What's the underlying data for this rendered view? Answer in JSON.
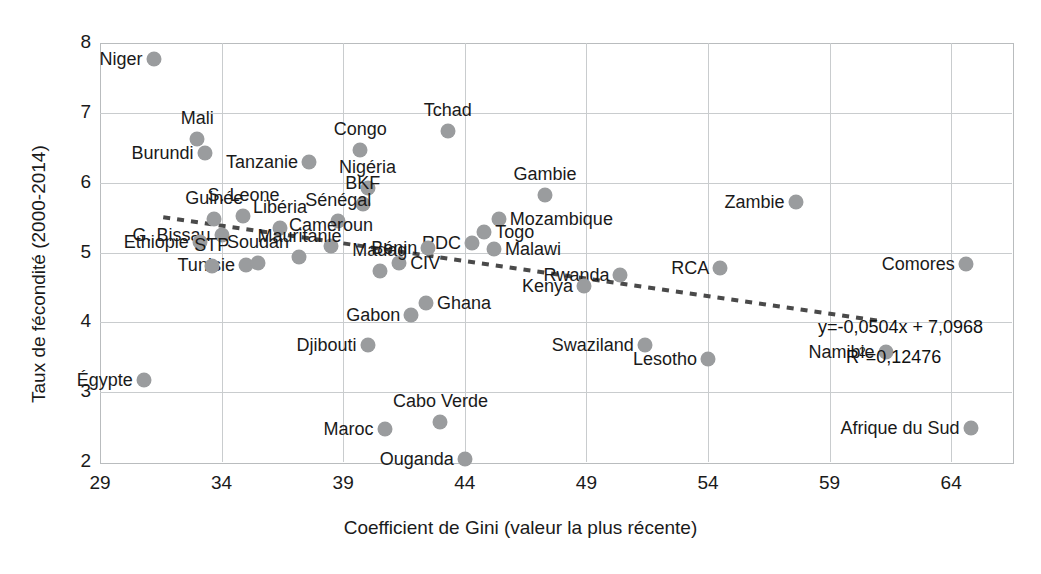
{
  "chart_data": {
    "type": "scatter",
    "title": "",
    "xlabel": "Coefficient de Gini (valeur la plus récente)",
    "ylabel": "Taux de fécondité (2000-2014)",
    "xlim": [
      29,
      66.5
    ],
    "ylim": [
      2,
      8
    ],
    "xticks": [
      29,
      34,
      39,
      44,
      49,
      54,
      59,
      64
    ],
    "yticks": [
      2,
      3,
      4,
      5,
      6,
      7,
      8
    ],
    "grid": true,
    "legend": "none",
    "marker_color": "#9a9c9e",
    "trendline": {
      "style": "dotted",
      "color": "#4a4a4a",
      "slope": -0.0504,
      "intercept": 7.0968,
      "equation": "y=-0,0504x + 7,0968",
      "r2_label": "R²=0,12476",
      "r2": 0.12476,
      "x_start": 31.6,
      "x_end": 61.2
    },
    "points": [
      {
        "label": "Niger",
        "x": 31.2,
        "y": 7.77,
        "label_side": "left"
      },
      {
        "label": "Mali",
        "x": 33.0,
        "y": 6.63,
        "label_side": "above"
      },
      {
        "label": "Burundi",
        "x": 33.3,
        "y": 6.43,
        "label_side": "left"
      },
      {
        "label": "Tanzanie",
        "x": 37.6,
        "y": 6.3,
        "label_side": "left"
      },
      {
        "label": "Congo",
        "x": 39.7,
        "y": 6.47,
        "label_side": "above"
      },
      {
        "label": "Tchad",
        "x": 43.3,
        "y": 6.74,
        "label_side": "above"
      },
      {
        "label": "Nigéria",
        "x": 40.0,
        "y": 5.93,
        "label_side": "above"
      },
      {
        "label": "Gambie",
        "x": 47.3,
        "y": 5.82,
        "label_side": "above"
      },
      {
        "label": "BKF",
        "x": 39.8,
        "y": 5.7,
        "label_side": "above"
      },
      {
        "label": "Zambie",
        "x": 57.6,
        "y": 5.72,
        "label_side": "left"
      },
      {
        "label": "Mozambique",
        "x": 45.4,
        "y": 5.48,
        "label_side": "right"
      },
      {
        "label": "Sénégal",
        "x": 38.8,
        "y": 5.45,
        "label_side": "above"
      },
      {
        "label": "Togo",
        "x": 44.8,
        "y": 5.3,
        "label_side": "right"
      },
      {
        "label": "S. Leone",
        "x": 34.9,
        "y": 5.52,
        "label_side": "above"
      },
      {
        "label": "Guinée",
        "x": 33.7,
        "y": 5.48,
        "label_side": "above"
      },
      {
        "label": "Libéria",
        "x": 36.4,
        "y": 5.35,
        "label_side": "above"
      },
      {
        "label": "RDC",
        "x": 44.3,
        "y": 5.13,
        "label_side": "left"
      },
      {
        "label": "Bénin",
        "x": 42.5,
        "y": 5.06,
        "label_side": "left"
      },
      {
        "label": "G. Bissau",
        "x": 34.0,
        "y": 5.25,
        "label_side": "left"
      },
      {
        "label": "Ethiopie",
        "x": 33.1,
        "y": 5.15,
        "label_side": "left"
      },
      {
        "label": "Cameroun",
        "x": 38.5,
        "y": 5.1,
        "label_side": "above"
      },
      {
        "label": "Malawi",
        "x": 45.2,
        "y": 5.05,
        "label_side": "right"
      },
      {
        "label": "Mauritanie",
        "x": 37.2,
        "y": 4.93,
        "label_side": "above"
      },
      {
        "label": "Tunisie",
        "x": 35.0,
        "y": 4.82,
        "label_side": "left"
      },
      {
        "label": "CIV",
        "x": 41.3,
        "y": 4.85,
        "label_side": "right"
      },
      {
        "label": "Rwanda",
        "x": 50.4,
        "y": 4.68,
        "label_side": "left"
      },
      {
        "label": "RCA",
        "x": 54.5,
        "y": 4.78,
        "label_side": "left"
      },
      {
        "label": "Comores",
        "x": 64.6,
        "y": 4.84,
        "label_side": "left"
      },
      {
        "label": "Kenya",
        "x": 48.9,
        "y": 4.52,
        "label_side": "left"
      },
      {
        "label": "STP",
        "x": 33.6,
        "y": 4.8,
        "label_side": "above"
      },
      {
        "label": "Soudan",
        "x": 35.5,
        "y": 4.85,
        "label_side": "above"
      },
      {
        "label": "Madag",
        "x": 40.5,
        "y": 4.74,
        "label_side": "above"
      },
      {
        "label": "Ghana",
        "x": 42.4,
        "y": 4.27,
        "label_side": "right"
      },
      {
        "label": "Gabon",
        "x": 41.8,
        "y": 4.1,
        "label_side": "left"
      },
      {
        "label": "Djibouti",
        "x": 40.0,
        "y": 3.67,
        "label_side": "left"
      },
      {
        "label": "Swaziland",
        "x": 51.4,
        "y": 3.67,
        "label_side": "left"
      },
      {
        "label": "Lesotho",
        "x": 54.0,
        "y": 3.47,
        "label_side": "left"
      },
      {
        "label": "Namibie",
        "x": 61.3,
        "y": 3.58,
        "label_side": "left"
      },
      {
        "label": "Égypte",
        "x": 30.8,
        "y": 3.17,
        "label_side": "left"
      },
      {
        "label": "Cabo Verde",
        "x": 43.0,
        "y": 2.57,
        "label_side": "above"
      },
      {
        "label": "Maroc",
        "x": 40.7,
        "y": 2.47,
        "label_side": "left"
      },
      {
        "label": "Afrique du  Sud",
        "x": 64.8,
        "y": 2.49,
        "label_side": "left"
      },
      {
        "label": "Ouganda",
        "x": 44.0,
        "y": 2.05,
        "label_side": "left"
      }
    ]
  }
}
